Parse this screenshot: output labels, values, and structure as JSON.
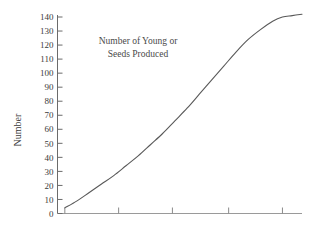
{
  "chart_data": {
    "type": "line",
    "title": "Number of Young or Seeds Produced",
    "title_lines": [
      "Number of Young or",
      "Seeds Produced"
    ],
    "xlabel": "",
    "ylabel": "Number",
    "ylim": [
      0,
      140
    ],
    "xlim": [
      0,
      100
    ],
    "ytick_step": 10,
    "grid": false,
    "legend": "none",
    "line_color": "#595959",
    "axis_color": "#6b6b6b",
    "text_color": "#3b3b3b",
    "background": "#ffffff",
    "yticks": [
      "0",
      "10",
      "20",
      "30",
      "40",
      "50",
      "60",
      "70",
      "80",
      "90",
      "100",
      "110",
      "120",
      "130",
      "140"
    ],
    "ytick_values": [
      0,
      10,
      20,
      30,
      40,
      50,
      60,
      70,
      80,
      90,
      100,
      110,
      120,
      130,
      140
    ],
    "xticks": [
      "",
      "",
      "",
      "",
      ""
    ],
    "xtick_positions": [
      3,
      25,
      47,
      70,
      92
    ],
    "series": [
      {
        "name": "Number of Young or Seeds Produced",
        "x": [
          3,
          8,
          13,
          18,
          23,
          28,
          33,
          38,
          43,
          48,
          53,
          58,
          63,
          68,
          73,
          78,
          83,
          88,
          92,
          96,
          100
        ],
        "values": [
          4,
          9,
          15,
          21,
          27,
          34,
          41,
          49,
          57,
          66,
          75,
          85,
          95,
          105,
          115,
          124,
          131,
          137,
          140,
          141,
          142
        ]
      }
    ],
    "annotations": {
      "curve_shape": "sigmoid",
      "start_value": 4,
      "asymptote": 142,
      "inflection_value": 72
    }
  }
}
